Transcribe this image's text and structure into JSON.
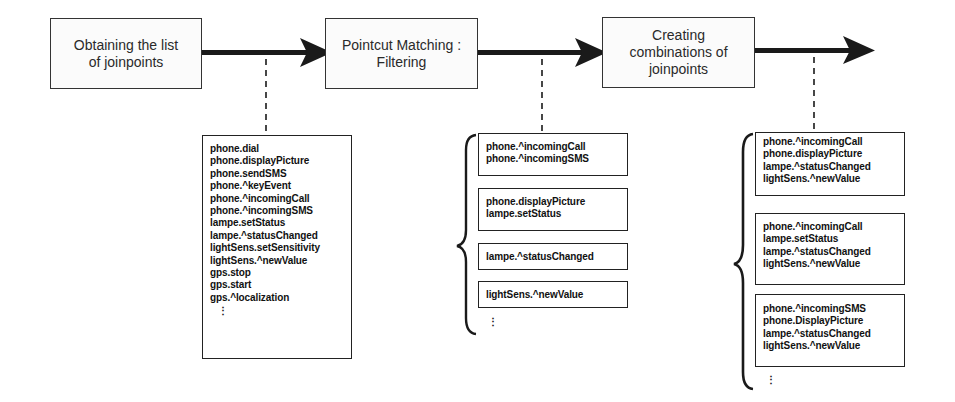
{
  "diagram": {
    "type": "process-flow",
    "steps": [
      {
        "label_line1": "Obtaining the list",
        "label_line2": "of joinpoints"
      },
      {
        "label_line1": "Pointcut Matching :",
        "label_line2": "Filtering"
      },
      {
        "label_line1": "Creating",
        "label_line2": "combinations of",
        "label_line3": "joinpoints"
      }
    ],
    "joinpoint_list": {
      "items": [
        "phone.dial",
        "phone.displayPicture",
        "phone.sendSMS",
        "phone.^keyEvent",
        "phone.^incomingCall",
        "phone.^incomingSMS",
        "lampe.setStatus",
        "lampe.^statusChanged",
        "lightSens.setSensitivity",
        "lightSens.^newValue",
        "gps.stop",
        "gps.start",
        "gps.^localization"
      ],
      "more": "⋮"
    },
    "filtered_groups": [
      {
        "items": [
          "phone.^incomingCall",
          "phone.^incomingSMS"
        ]
      },
      {
        "items": [
          "phone.displayPicture",
          "lampe.setStatus"
        ]
      },
      {
        "items": [
          "lampe.^statusChanged"
        ]
      },
      {
        "items": [
          "lightSens.^newValue"
        ]
      }
    ],
    "filtered_more": "⋮",
    "combinations": [
      {
        "items": [
          "phone.^incomingCall",
          "phone.displayPicture",
          "lampe.^statusChanged",
          "lightSens.^newValue"
        ]
      },
      {
        "items": [
          "phone.^incomingCall",
          "lampe.setStatus",
          "lampe.^statusChanged",
          "lightSens.^newValue"
        ]
      },
      {
        "items": [
          "phone.^incomingSMS",
          "phone.DisplayPicture",
          "lampe.^statusChanged",
          "lightSens.^newValue"
        ]
      }
    ],
    "combinations_more": "⋮",
    "colors": {
      "line": "#1a1a1a",
      "box_border": "#333333",
      "text": "#1a1a1a"
    }
  }
}
